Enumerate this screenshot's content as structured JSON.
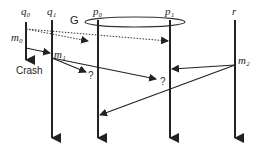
{
  "processes": [
    {
      "id": "q0",
      "label": "q₀"
    },
    {
      "id": "q1",
      "label": "q₁"
    },
    {
      "id": "p0",
      "label": "p₀"
    },
    {
      "id": "p1",
      "label": "p₁"
    },
    {
      "id": "r",
      "label": "r"
    }
  ],
  "group": {
    "label": "G"
  },
  "messages": {
    "m0": "m₀",
    "m1": "m₁",
    "m2": "m₂"
  },
  "annotations": {
    "crash": "Crash",
    "unknown1": "?",
    "unknown2": "?"
  }
}
